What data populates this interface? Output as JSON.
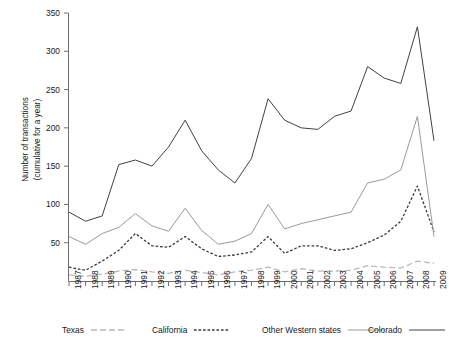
{
  "caption": {
    "partial_top_text": ""
  },
  "axes": {
    "y_title_line1": "Number of transactions",
    "y_title_line2": "(cumulative for a year)",
    "y_ticks": [
      "0",
      "50",
      "100",
      "150",
      "200",
      "250",
      "300",
      "350"
    ],
    "y_ticks_visible": [
      "50",
      "100",
      "150",
      "200",
      "250",
      "300",
      "350"
    ],
    "x_title": ""
  },
  "legend": {
    "items": [
      {
        "label": "Texas",
        "style": "long-dash",
        "color": "#b9b9b9"
      },
      {
        "label": "California",
        "style": "short-dash",
        "color": "#3a3a3a"
      },
      {
        "label": "Other Western states",
        "style": "solid",
        "color": "#9a9a9a"
      },
      {
        "label": "Colorado",
        "style": "solid",
        "color": "#404040"
      }
    ]
  },
  "chart_data": {
    "type": "line",
    "title": "",
    "xlabel": "",
    "ylabel": "Number of transactions (cumulative for a year)",
    "ylim": [
      0,
      350
    ],
    "ytick_step": 50,
    "grid": false,
    "legend_position": "bottom",
    "categories": [
      "1987",
      "1988",
      "1989",
      "1990",
      "1991",
      "1992",
      "1993",
      "1994",
      "1995",
      "1996",
      "1997",
      "1998",
      "1999",
      "2000",
      "2001",
      "2002",
      "2003",
      "2004",
      "2005",
      "2006",
      "2007",
      "2008",
      "2009"
    ],
    "series": [
      {
        "name": "Colorado",
        "color": "#404040",
        "style": "solid",
        "values": [
          90,
          78,
          85,
          152,
          158,
          150,
          175,
          210,
          170,
          145,
          128,
          160,
          238,
          210,
          200,
          198,
          215,
          222,
          280,
          265,
          258,
          332,
          183
        ]
      },
      {
        "name": "Other Western states",
        "color": "#9a9a9a",
        "style": "solid",
        "values": [
          58,
          48,
          62,
          70,
          88,
          72,
          65,
          95,
          66,
          48,
          52,
          62,
          100,
          68,
          75,
          80,
          85,
          90,
          128,
          133,
          145,
          215,
          58
        ]
      },
      {
        "name": "California",
        "color": "#3a3a3a",
        "style": "short-dash",
        "values": [
          18,
          14,
          26,
          40,
          62,
          46,
          44,
          58,
          42,
          32,
          34,
          38,
          58,
          36,
          46,
          46,
          40,
          42,
          50,
          60,
          78,
          124,
          64
        ]
      },
      {
        "name": "Texas",
        "color": "#b9b9b9",
        "style": "long-dash",
        "values": [
          8,
          6,
          9,
          13,
          15,
          12,
          10,
          14,
          11,
          8,
          12,
          14,
          18,
          12,
          16,
          13,
          13,
          14,
          20,
          18,
          17,
          26,
          23
        ]
      }
    ]
  }
}
